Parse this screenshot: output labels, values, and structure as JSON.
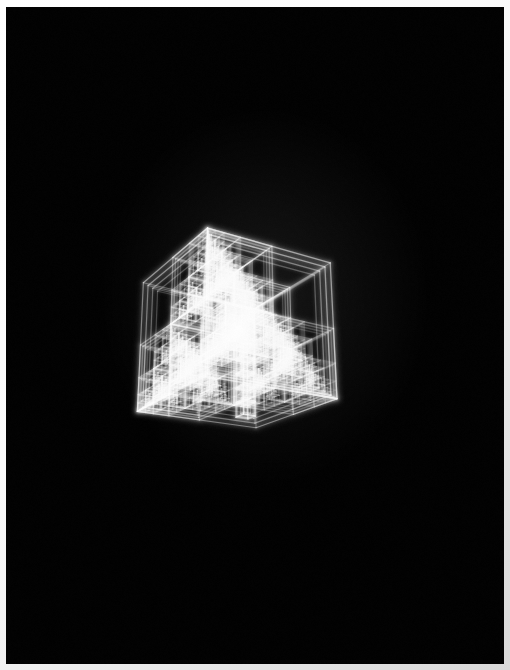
{
  "artwork": {
    "title": "Recursive Nested Cube Wireframe",
    "subject": "fractal nested cube lattice",
    "technique": "glowing additive wireframe render",
    "palette": {
      "background": "#000000",
      "edge_glow": "#ffffff",
      "edge_dim": "#6e6e6e",
      "mount_light": "#ffffff",
      "mount_shadow": "#d9d9d9"
    },
    "plate": {
      "left": 6,
      "top": 7,
      "width": 498,
      "height": 657,
      "background": "#000000"
    },
    "canvas": {
      "width": 498,
      "height": 657
    }
  },
  "scene": {
    "projection": "perspective",
    "camera": {
      "distance": 5.2,
      "focal_length": 3.15,
      "yaw_degrees": -31,
      "pitch_degrees": 20,
      "roll_degrees": 0
    },
    "origin_x": 228,
    "origin_y": 330,
    "scale": 232,
    "recursion_depth": 5,
    "child_scale": 0.5,
    "frame_inset_count": 4,
    "frame_inset_step": 0.055,
    "base_line_width": 1.15,
    "base_opacity": 0.72,
    "glow_blur": 2.1,
    "glow_opacity": 0.5,
    "depth_fade": 0.62,
    "seed": 20147
  },
  "cube_tree": {
    "root": {
      "cx": 0,
      "cy": 0,
      "cz": 0,
      "size": 1.0,
      "brightness": 0.95
    },
    "children_offsets": [
      {
        "name": "upper-left-back",
        "dx": -0.25,
        "dy": 0.25,
        "dz": -0.25,
        "size": 0.5,
        "brightness": 0.6
      },
      {
        "name": "upper-right-front",
        "dx": 0.25,
        "dy": 0.25,
        "dz": 0.25,
        "size": 0.5,
        "brightness": 1.0
      },
      {
        "name": "lower-left-front",
        "dx": -0.25,
        "dy": -0.25,
        "dz": 0.25,
        "size": 0.5,
        "brightness": 0.74
      },
      {
        "name": "lower-right-back",
        "dx": 0.25,
        "dy": -0.25,
        "dz": -0.25,
        "size": 0.5,
        "brightness": 0.52
      },
      {
        "name": "core-center",
        "dx": 0.0,
        "dy": 0.0,
        "dz": 0.0,
        "size": 0.34,
        "brightness": 0.88
      }
    ],
    "column": {
      "name": "bright-vertical-column",
      "axis": "y",
      "dx": 0.25,
      "dz": 0.25,
      "cell_count": 9,
      "cell_size": 0.105,
      "brightness": 1.0
    }
  },
  "chart_data": {
    "type": "scatter",
    "xlabel": "",
    "ylabel": ""
  }
}
